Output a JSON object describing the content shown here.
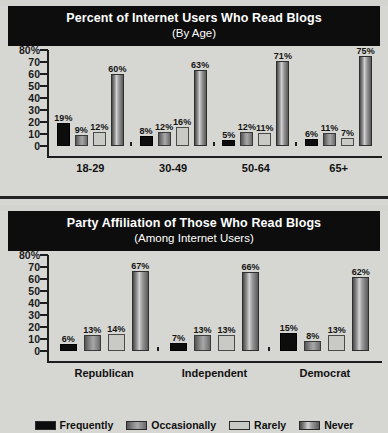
{
  "charts": [
    {
      "title": "Percent of Internet Users Who Read Blogs",
      "subtitle": "(By Age)"
    },
    {
      "title": "Party Affiliation of Those Who Read Blogs",
      "subtitle": "(Among Internet Users)"
    }
  ],
  "yticks": [
    "80%",
    "70",
    "60",
    "50",
    "40",
    "30",
    "20",
    "10",
    "0"
  ],
  "legend": [
    {
      "label": "Frequently",
      "color": "#0d0d0d"
    },
    {
      "label": "Occasionally",
      "color": "#6f6f6f"
    },
    {
      "label": "Rarely",
      "color": "#c4c4c0"
    },
    {
      "label": "Never",
      "color": "#7c7c7c"
    }
  ],
  "chart_data": [
    {
      "type": "bar",
      "title": "Percent of Internet Users Who Read Blogs",
      "subtitle": "(By Age)",
      "xlabel": "",
      "ylabel": "",
      "ylim": [
        0,
        80
      ],
      "yticks": [
        0,
        10,
        20,
        30,
        40,
        50,
        60,
        70,
        80
      ],
      "grid": false,
      "legend_position": "bottom",
      "categories": [
        "18-29",
        "30-49",
        "50-64",
        "65+"
      ],
      "series": [
        {
          "name": "Frequently",
          "values": [
            19,
            8,
            5,
            6
          ],
          "labels": [
            "19%",
            "8%",
            "5%",
            "6%"
          ]
        },
        {
          "name": "Occasionally",
          "values": [
            9,
            12,
            12,
            11
          ],
          "labels": [
            "9%",
            "12%",
            "12%",
            "11%"
          ]
        },
        {
          "name": "Rarely",
          "values": [
            12,
            16,
            11,
            7
          ],
          "labels": [
            "12%",
            "16%",
            "11%",
            "7%"
          ]
        },
        {
          "name": "Never",
          "values": [
            60,
            63,
            71,
            75
          ],
          "labels": [
            "60%",
            "63%",
            "71%",
            "75%"
          ]
        }
      ]
    },
    {
      "type": "bar",
      "title": "Party Affiliation of Those Who Read Blogs",
      "subtitle": "(Among Internet Users)",
      "xlabel": "",
      "ylabel": "",
      "ylim": [
        0,
        80
      ],
      "yticks": [
        0,
        10,
        20,
        30,
        40,
        50,
        60,
        70,
        80
      ],
      "grid": false,
      "legend_position": "bottom",
      "categories": [
        "Republican",
        "Independent",
        "Democrat"
      ],
      "series": [
        {
          "name": "Frequently",
          "values": [
            6,
            7,
            15
          ],
          "labels": [
            "6%",
            "7%",
            "15%"
          ]
        },
        {
          "name": "Occasionally",
          "values": [
            13,
            13,
            8
          ],
          "labels": [
            "13%",
            "13%",
            "8%"
          ]
        },
        {
          "name": "Rarely",
          "values": [
            14,
            13,
            13
          ],
          "labels": [
            "14%",
            "13%",
            "13%"
          ]
        },
        {
          "name": "Never",
          "values": [
            67,
            66,
            62
          ],
          "labels": [
            "67%",
            "66%",
            "62%"
          ]
        }
      ]
    }
  ]
}
